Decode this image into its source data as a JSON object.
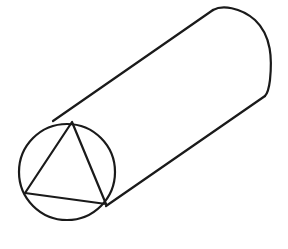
{
  "figure": {
    "shapes": [
      "cylinder-body",
      "front-circle",
      "inscribed-triangle"
    ],
    "stroke_color": "#1a1a1a",
    "background_color": "#ffffff"
  }
}
